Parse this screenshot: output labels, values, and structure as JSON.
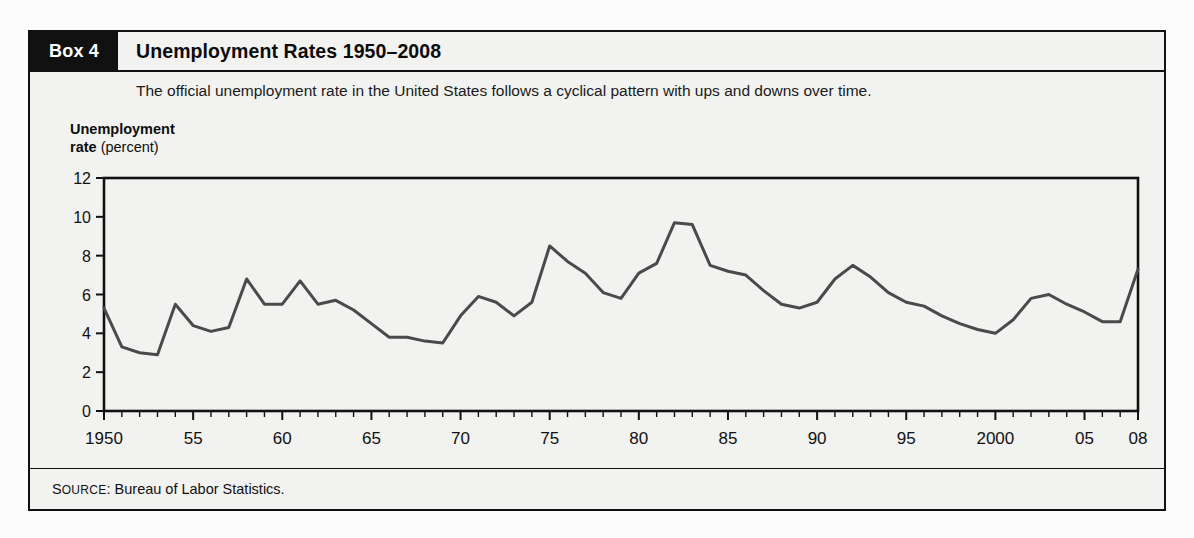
{
  "box": {
    "tag": "Box 4",
    "title": "Unemployment Rates 1950–2008",
    "subtitle": "The official unemployment rate in the United States follows a cyclical pattern with ups and downs over time.",
    "source_prefix_cap": "S",
    "source_prefix_rest": "OURCE",
    "source_colon": ":",
    "source_text": "Bureau of Labor Statistics."
  },
  "axis_title": {
    "bold_part": "Unemployment",
    "bold_part2": "rate",
    "light_part": "(percent)"
  },
  "colors": {
    "line": "#4a4a4a",
    "frame": "#111111",
    "box_background": "#f2f2f0",
    "tag_background": "#111111",
    "tag_text": "#ffffff"
  },
  "chart_data": {
    "type": "line",
    "title": "Unemployment Rates 1950–2008",
    "xlabel": "",
    "ylabel": "Unemployment rate (percent)",
    "xlim": [
      1950,
      2008
    ],
    "ylim": [
      0,
      12
    ],
    "grid": false,
    "legend": "none",
    "y_ticks": [
      0,
      2,
      4,
      6,
      8,
      10,
      12
    ],
    "y_tick_labels": [
      "0",
      "2",
      "4",
      "6",
      "8",
      "10",
      "12"
    ],
    "x_tick_years": [
      1950,
      1951,
      1952,
      1953,
      1954,
      1955,
      1956,
      1957,
      1958,
      1959,
      1960,
      1961,
      1962,
      1963,
      1964,
      1965,
      1966,
      1967,
      1968,
      1969,
      1970,
      1971,
      1972,
      1973,
      1974,
      1975,
      1976,
      1977,
      1978,
      1979,
      1980,
      1981,
      1982,
      1983,
      1984,
      1985,
      1986,
      1987,
      1988,
      1989,
      1990,
      1991,
      1992,
      1993,
      1994,
      1995,
      1996,
      1997,
      1998,
      1999,
      2000,
      2001,
      2002,
      2003,
      2004,
      2005,
      2006,
      2007,
      2008
    ],
    "x_labeled_ticks": [
      {
        "year": 1950,
        "label": "1950"
      },
      {
        "year": 1955,
        "label": "55"
      },
      {
        "year": 1960,
        "label": "60"
      },
      {
        "year": 1965,
        "label": "65"
      },
      {
        "year": 1970,
        "label": "70"
      },
      {
        "year": 1975,
        "label": "75"
      },
      {
        "year": 1980,
        "label": "80"
      },
      {
        "year": 1985,
        "label": "85"
      },
      {
        "year": 1990,
        "label": "90"
      },
      {
        "year": 1995,
        "label": "95"
      },
      {
        "year": 2000,
        "label": "2000"
      },
      {
        "year": 2005,
        "label": "05"
      },
      {
        "year": 2008,
        "label": "08"
      }
    ],
    "x": [
      1950,
      1951,
      1952,
      1953,
      1954,
      1955,
      1956,
      1957,
      1958,
      1959,
      1960,
      1961,
      1962,
      1963,
      1964,
      1965,
      1966,
      1967,
      1968,
      1969,
      1970,
      1971,
      1972,
      1973,
      1974,
      1975,
      1976,
      1977,
      1978,
      1979,
      1980,
      1981,
      1982,
      1983,
      1984,
      1985,
      1986,
      1987,
      1988,
      1989,
      1990,
      1991,
      1992,
      1993,
      1994,
      1995,
      1996,
      1997,
      1998,
      1999,
      2000,
      2001,
      2002,
      2003,
      2004,
      2005,
      2006,
      2007,
      2008
    ],
    "values": [
      5.3,
      3.3,
      3.0,
      2.9,
      5.5,
      4.4,
      4.1,
      4.3,
      6.8,
      5.5,
      5.5,
      6.7,
      5.5,
      5.7,
      5.2,
      4.5,
      3.8,
      3.8,
      3.6,
      3.5,
      4.9,
      5.9,
      5.6,
      4.9,
      5.6,
      8.5,
      7.7,
      7.1,
      6.1,
      5.8,
      7.1,
      7.6,
      9.7,
      9.6,
      7.5,
      7.2,
      7.0,
      6.2,
      5.5,
      5.3,
      5.6,
      6.8,
      7.5,
      6.9,
      6.1,
      5.6,
      5.4,
      4.9,
      4.5,
      4.2,
      4.0,
      4.7,
      5.8,
      6.0,
      5.5,
      5.1,
      4.6,
      4.6,
      7.3
    ],
    "series": [
      {
        "name": "Unemployment rate",
        "values": [
          5.3,
          3.3,
          3.0,
          2.9,
          5.5,
          4.4,
          4.1,
          4.3,
          6.8,
          5.5,
          5.5,
          6.7,
          5.5,
          5.7,
          5.2,
          4.5,
          3.8,
          3.8,
          3.6,
          3.5,
          4.9,
          5.9,
          5.6,
          4.9,
          5.6,
          8.5,
          7.7,
          7.1,
          6.1,
          5.8,
          7.1,
          7.6,
          9.7,
          9.6,
          7.5,
          7.2,
          7.0,
          6.2,
          5.5,
          5.3,
          5.6,
          6.8,
          7.5,
          6.9,
          6.1,
          5.6,
          5.4,
          4.9,
          4.5,
          4.2,
          4.0,
          4.7,
          5.8,
          6.0,
          5.5,
          5.1,
          4.6,
          4.6,
          7.3
        ]
      }
    ]
  }
}
